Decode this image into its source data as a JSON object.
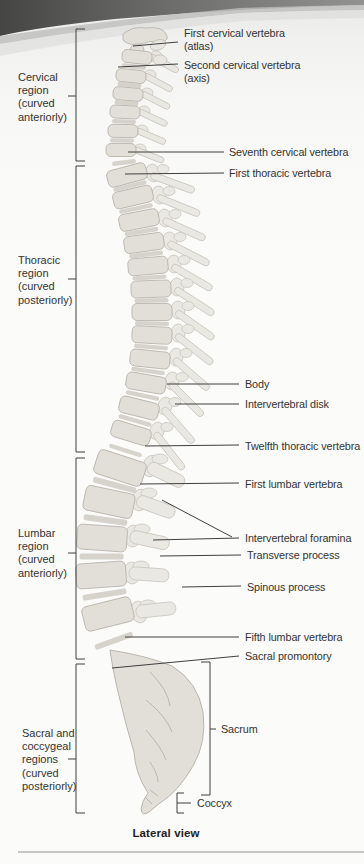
{
  "figure": {
    "caption": "Lateral view",
    "region_labels": [
      {
        "text": "Cervical\nregion\n(curved\nanteriorly)"
      },
      {
        "text": "Thoracic\nregion\n(curved\nposteriorly)"
      },
      {
        "text": "Lumbar\nregion\n(curved\nanteriorly)"
      },
      {
        "text": "Sacral and\ncoccygeal\nregions\n(curved\nposteriorly)"
      }
    ],
    "annotations": [
      {
        "text": "First cervical vertebra\n(atlas)"
      },
      {
        "text": "Second cervical vertebra\n(axis)"
      },
      {
        "text": "Seventh cervical vertebra"
      },
      {
        "text": "First thoracic vertebra"
      },
      {
        "text": "Body"
      },
      {
        "text": "Intervertebral disk"
      },
      {
        "text": "Twelfth thoracic vertebra"
      },
      {
        "text": "First lumbar vertebra"
      },
      {
        "text": "Intervertebral foramina"
      },
      {
        "text": "Transverse process"
      },
      {
        "text": "Spinous process"
      },
      {
        "text": "Fifth lumbar vertebra"
      },
      {
        "text": "Sacral promontory"
      },
      {
        "text": "Sacrum"
      },
      {
        "text": "Coccyx"
      }
    ],
    "colors": {
      "bone": "#e1dfd8",
      "bone_light": "#e8e6e0",
      "disk": "#c9c6bd",
      "line": "#3f3f3f",
      "page_shadow": "#474745"
    }
  }
}
